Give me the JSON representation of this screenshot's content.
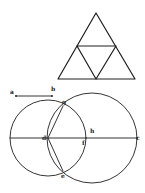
{
  "figure": {
    "triangle": {
      "vertices": [
        [
          96,
          13
        ],
        [
          58,
          79
        ],
        [
          135,
          79
        ]
      ],
      "midpoints": [
        [
          77,
          46
        ],
        [
          116,
          46
        ],
        [
          96,
          79
        ]
      ]
    },
    "segment_ab": {
      "a": {
        "label": "a",
        "pos": [
          16,
          96
        ]
      },
      "b": {
        "label": "b",
        "pos": [
          52,
          96
        ]
      }
    },
    "circles": [
      {
        "name": "circle-d",
        "center": [
          48,
          138
        ],
        "r": 38
      },
      {
        "name": "circle-h",
        "center": [
          92,
          138
        ],
        "r": 45
      }
    ],
    "points": {
      "d": {
        "label": "d",
        "pos": [
          48,
          138
        ]
      },
      "c": {
        "label": "c",
        "pos": [
          137,
          138
        ]
      },
      "h": {
        "label": "h",
        "pos": [
          92,
          131
        ]
      },
      "f": {
        "label": "f",
        "pos": [
          83,
          143
        ]
      },
      "g": {
        "label": "g",
        "pos": [
          63,
          103
        ]
      },
      "e": {
        "label": "e",
        "pos": [
          63,
          174
        ]
      }
    },
    "stroke_color": "#1e1e1e",
    "background": "#ffffff"
  }
}
